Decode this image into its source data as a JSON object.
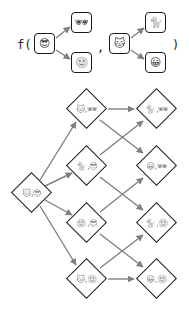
{
  "function": {
    "name_text": "f(",
    "separator": ",",
    "close_text": ")"
  },
  "args": [
    {
      "source": {
        "icon": "cool-face",
        "glyph": "😎"
      },
      "targets": [
        {
          "icon": "sunglasses",
          "glyph": "🕶"
        },
        {
          "icon": "slight-smile-face",
          "glyph": "🙂"
        }
      ]
    },
    {
      "source": {
        "icon": "cat-face",
        "glyph": "🐱"
      },
      "targets": [
        {
          "icon": "cat",
          "glyph": "🐈"
        },
        {
          "icon": "grinning-face",
          "glyph": "😀"
        }
      ]
    }
  ],
  "lattice": {
    "root": {
      "a": "🐱",
      "b": "😎",
      "sep": ","
    },
    "middle": [
      {
        "a": "🐱",
        "b": "🕶",
        "sep": ","
      },
      {
        "a": "🐈",
        "b": "😎",
        "sep": ","
      },
      {
        "a": "🙂",
        "b": "😎",
        "sep": ","
      },
      {
        "a": "🐱",
        "b": "🙂",
        "sep": ","
      }
    ],
    "right": [
      {
        "a": "🐈",
        "b": "🕶",
        "sep": ","
      },
      {
        "a": "😀",
        "b": "🕶",
        "sep": ","
      },
      {
        "a": "🐈",
        "b": "🙂",
        "sep": ","
      },
      {
        "a": "😀",
        "b": "🙂",
        "sep": ","
      }
    ],
    "edges": [
      [
        "root",
        "middle.0"
      ],
      [
        "root",
        "middle.1"
      ],
      [
        "root",
        "middle.2"
      ],
      [
        "root",
        "middle.3"
      ],
      [
        "middle.0",
        "right.0"
      ],
      [
        "middle.0",
        "right.1"
      ],
      [
        "middle.1",
        "right.0"
      ],
      [
        "middle.1",
        "right.2"
      ],
      [
        "middle.2",
        "right.1"
      ],
      [
        "middle.2",
        "right.3"
      ],
      [
        "middle.3",
        "right.2"
      ],
      [
        "middle.3",
        "right.3"
      ]
    ]
  },
  "colors": {
    "outline": "#1a1a1a",
    "arrow": "#808080",
    "background": "#ffffff"
  }
}
